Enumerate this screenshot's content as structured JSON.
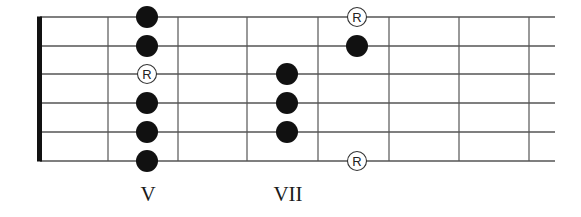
{
  "diagram": {
    "type": "guitar-fretboard-scale-pattern",
    "num_strings": 6,
    "colors": {
      "line": "#555555",
      "nut": "#111111",
      "dot": "#111111",
      "root_fill": "#ffffff"
    },
    "geometry": {
      "nut_x": 37,
      "nut_width": 5,
      "string_start_x": 40,
      "string_end_x": 555,
      "string_y": [
        17,
        46,
        74,
        103,
        132,
        161
      ],
      "fret_x": [
        108,
        178,
        247,
        318,
        389,
        459,
        529
      ]
    },
    "notes": [
      {
        "x": 147,
        "string": 0,
        "type": "dot"
      },
      {
        "x": 147,
        "string": 1,
        "type": "dot"
      },
      {
        "x": 147,
        "string": 2,
        "type": "root",
        "label": "R"
      },
      {
        "x": 147,
        "string": 3,
        "type": "dot"
      },
      {
        "x": 147,
        "string": 4,
        "type": "dot"
      },
      {
        "x": 147,
        "string": 5,
        "type": "dot"
      },
      {
        "x": 287,
        "string": 2,
        "type": "dot"
      },
      {
        "x": 287,
        "string": 3,
        "type": "dot"
      },
      {
        "x": 287,
        "string": 4,
        "type": "dot"
      },
      {
        "x": 357,
        "string": 0,
        "type": "root",
        "label": "R"
      },
      {
        "x": 357,
        "string": 1,
        "type": "dot"
      },
      {
        "x": 357,
        "string": 5,
        "type": "root",
        "label": "R"
      }
    ],
    "fret_labels": [
      {
        "text": "V",
        "x": 148
      },
      {
        "text": "VII",
        "x": 288
      }
    ]
  }
}
